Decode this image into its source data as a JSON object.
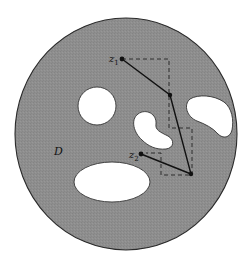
{
  "diagram": {
    "region_label": "D",
    "points": {
      "z1": {
        "label": "z",
        "subscript": "1",
        "x": 122,
        "y": 59
      },
      "z2": {
        "label": "z",
        "subscript": "2",
        "x": 141,
        "y": 154
      }
    },
    "polygonal_path": [
      [
        122,
        59
      ],
      [
        170,
        95
      ],
      [
        191,
        174
      ],
      [
        141,
        154
      ]
    ],
    "dashed_path": [
      [
        122,
        59
      ],
      [
        169,
        59
      ],
      [
        169,
        128
      ],
      [
        192,
        128
      ],
      [
        192,
        175
      ],
      [
        161,
        175
      ],
      [
        161,
        153
      ],
      [
        146,
        153
      ]
    ],
    "colors": {
      "region_fill": "#8c8c8c",
      "hole_fill": "#ffffff",
      "stroke": "#1a1a1a",
      "background": "#ffffff"
    }
  }
}
